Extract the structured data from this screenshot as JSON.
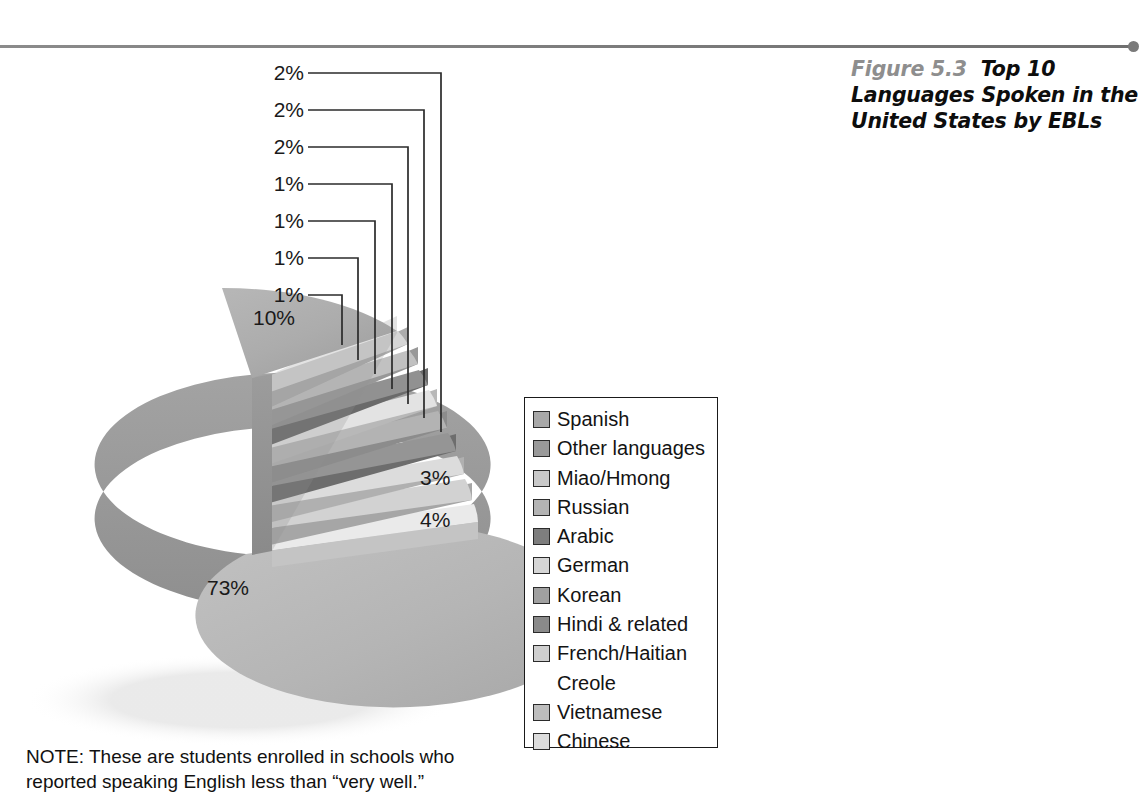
{
  "figure": {
    "number": "Figure 5.3",
    "title": "Top 10 Languages Spoken in the United States by EBLs"
  },
  "note": {
    "line1": "NOTE: These are students enrolled in schools who",
    "line2": "reported speaking English less than “very well.”"
  },
  "legend": {
    "items": [
      {
        "label": "Spanish",
        "color": "#a8a8a8"
      },
      {
        "label": "Other languages",
        "color": "#9a9a9a"
      },
      {
        "label": "Miao/Hmong",
        "color": "#c9c9c9"
      },
      {
        "label": "Russian",
        "color": "#b4b4b4"
      },
      {
        "label": "Arabic",
        "color": "#7e7e7e"
      },
      {
        "label": "German",
        "color": "#d6d6d6"
      },
      {
        "label": "Korean",
        "color": "#a0a0a0"
      },
      {
        "label": "Hindi & related",
        "color": "#8a8a8a"
      },
      {
        "label": "French/Haitian",
        "color": "#cfcfcf",
        "cont": "Creole"
      },
      {
        "label": "Vietnamese",
        "color": "#bdbdbd"
      },
      {
        "label": "Chinese",
        "color": "#dcdcdc"
      }
    ]
  },
  "chart_data": {
    "type": "pie",
    "title": "Top 10 Languages Spoken in the United States by EBLs",
    "units": "percent",
    "exploded": true,
    "three_d": true,
    "legend_position": "right",
    "categories": [
      "Spanish",
      "Chinese",
      "Vietnamese",
      "French/Haitian Creole",
      "Hindi & related",
      "Korean",
      "German",
      "Arabic",
      "Russian",
      "Miao/Hmong",
      "Other languages"
    ],
    "values": [
      73,
      4,
      3,
      2,
      2,
      2,
      1,
      1,
      1,
      1,
      10
    ],
    "labels": [
      "73%",
      "4%",
      "3%",
      "2%",
      "2%",
      "2%",
      "1%",
      "1%",
      "1%",
      "1%",
      "10%"
    ],
    "slice_colors": [
      "#b5b5b5",
      "#e2e2e2",
      "#c6c6c6",
      "#d8d8d8",
      "#8f8f8f",
      "#a6a6a6",
      "#dedede",
      "#848484",
      "#bcbcbc",
      "#d0d0d0",
      "#a4a4a4"
    ],
    "pie_labels_on_chart": [
      "73%",
      "4%",
      "3%",
      "10%"
    ],
    "leader_labels": [
      "2%",
      "2%",
      "2%",
      "1%",
      "1%",
      "1%",
      "1%"
    ]
  },
  "pie_labels": {
    "big": "73%",
    "four": "4%",
    "three": "3%",
    "ten": "10%"
  },
  "leaders": [
    {
      "text": "2%"
    },
    {
      "text": "2%"
    },
    {
      "text": "2%"
    },
    {
      "text": "1%"
    },
    {
      "text": "1%"
    },
    {
      "text": "1%"
    },
    {
      "text": "1%"
    }
  ]
}
